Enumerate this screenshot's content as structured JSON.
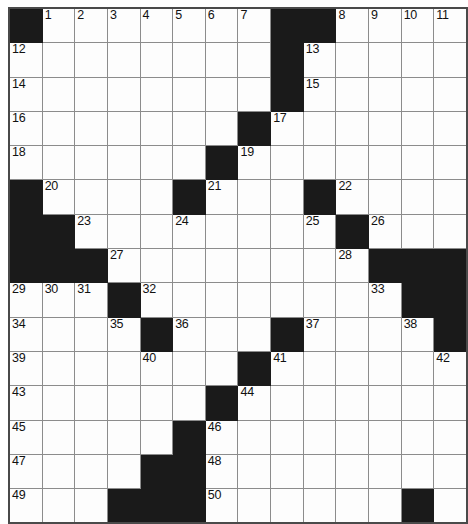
{
  "puzzle": {
    "title": "Crossword Grid",
    "rows": 15,
    "cols": 14,
    "colors": {
      "block": "#1a1a1a",
      "cell": "#fdfdfd",
      "grid_line": "#8c8c8c",
      "border": "#4a4a4a",
      "number": "#111111"
    },
    "grid": [
      [
        {
          "b": true
        },
        {
          "n": "1"
        },
        {
          "n": "2"
        },
        {
          "n": "3"
        },
        {
          "n": "4"
        },
        {
          "n": "5"
        },
        {
          "n": "6"
        },
        {
          "n": "7"
        },
        {
          "b": true
        },
        {
          "b": true
        },
        {
          "n": "8"
        },
        {
          "n": "9"
        },
        {
          "n": "10"
        },
        {
          "n": "11"
        }
      ],
      [
        {
          "n": "12"
        },
        {},
        {},
        {},
        {},
        {},
        {},
        {},
        {
          "b": true
        },
        {
          "n": "13"
        },
        {},
        {},
        {},
        {}
      ],
      [
        {
          "n": "14"
        },
        {},
        {},
        {},
        {},
        {},
        {},
        {},
        {
          "b": true
        },
        {
          "n": "15"
        },
        {},
        {},
        {},
        {}
      ],
      [
        {
          "n": "16"
        },
        {},
        {},
        {},
        {},
        {},
        {},
        {
          "b": true
        },
        {
          "n": "17"
        },
        {},
        {},
        {},
        {},
        {}
      ],
      [
        {
          "n": "18"
        },
        {},
        {},
        {},
        {},
        {},
        {
          "b": true
        },
        {
          "n": "19"
        },
        {},
        {},
        {},
        {},
        {},
        {}
      ],
      [
        {
          "b": true
        },
        {
          "n": "20"
        },
        {},
        {},
        {},
        {
          "b": true
        },
        {
          "n": "21"
        },
        {},
        {},
        {
          "b": true
        },
        {
          "n": "22"
        },
        {},
        {},
        {}
      ],
      [
        {
          "b": true
        },
        {
          "b": true
        },
        {
          "n": "23"
        },
        {},
        {},
        {
          "n": "24"
        },
        {},
        {},
        {},
        {
          "n": "25"
        },
        {
          "b": true
        },
        {
          "n": "26"
        },
        {},
        {}
      ],
      [
        {
          "b": true
        },
        {
          "b": true
        },
        {
          "b": true
        },
        {
          "n": "27"
        },
        {},
        {},
        {},
        {},
        {},
        {},
        {
          "n": "28"
        },
        {
          "b": true
        },
        {
          "b": true
        },
        {
          "b": true
        }
      ],
      [
        {
          "n": "29"
        },
        {
          "n": "30"
        },
        {
          "n": "31"
        },
        {
          "b": true
        },
        {
          "n": "32"
        },
        {},
        {},
        {},
        {},
        {},
        {},
        {
          "n": "33"
        },
        {
          "b": true
        },
        {
          "b": true
        }
      ],
      [
        {
          "n": "34"
        },
        {},
        {},
        {
          "n": "35"
        },
        {
          "b": true
        },
        {
          "n": "36"
        },
        {},
        {},
        {
          "b": true
        },
        {
          "n": "37"
        },
        {},
        {},
        {
          "n": "38"
        },
        {
          "b": true
        }
      ],
      [
        {
          "n": "39"
        },
        {},
        {},
        {},
        {
          "n": "40"
        },
        {},
        {},
        {
          "b": true
        },
        {
          "n": "41"
        },
        {},
        {},
        {},
        {},
        {
          "n": "42"
        }
      ],
      [
        {
          "n": "43"
        },
        {},
        {},
        {},
        {},
        {},
        {
          "b": true
        },
        {
          "n": "44"
        },
        {},
        {},
        {},
        {},
        {},
        {}
      ],
      [
        {
          "n": "45"
        },
        {},
        {},
        {},
        {},
        {
          "b": true
        },
        {
          "n": "46"
        },
        {},
        {},
        {},
        {},
        {},
        {},
        {}
      ],
      [
        {
          "n": "47"
        },
        {},
        {},
        {},
        {
          "b": true
        },
        {
          "b": true
        },
        {
          "n": "48"
        },
        {},
        {},
        {},
        {},
        {},
        {},
        {}
      ],
      [
        {
          "n": "49"
        },
        {},
        {},
        {
          "b": true
        },
        {
          "b": true
        },
        {
          "b": true
        },
        {
          "n": "50"
        },
        {},
        {},
        {},
        {},
        {},
        {
          "b": true
        },
        {}
      ]
    ]
  }
}
